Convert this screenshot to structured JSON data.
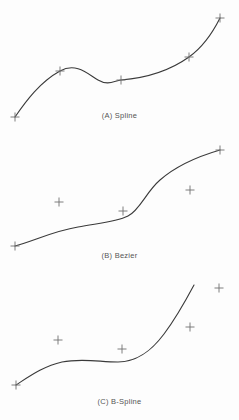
{
  "figure": {
    "width": 239,
    "height": 420,
    "background_color": "#fdfdfd",
    "curve_color": "#3a3a3a",
    "marker_color": "#707070",
    "caption_color": "#555555",
    "curve_width": 1.1,
    "marker_size": 9,
    "marker_glyph": "plus"
  },
  "chart_data": {
    "type": "line",
    "title": "",
    "xlabel": "",
    "ylabel": "",
    "grid": false,
    "legend": "none",
    "xlim": [
      0,
      239
    ],
    "ylim": [
      0,
      420
    ],
    "panels": [
      {
        "id": "A",
        "label": "(A) Spline",
        "interpolating": true,
        "control_points": [
          {
            "x": 15,
            "y": 117
          },
          {
            "x": 60,
            "y": 71
          },
          {
            "x": 121,
            "y": 80
          },
          {
            "x": 189,
            "y": 57
          },
          {
            "x": 220,
            "y": 18
          }
        ],
        "curve_path": "M 15 117 C 26 101 40 82 60 71 C 76 62 88 74 98 80 C 108 86 114 81 121 80 C 146 78 168 72 189 57 C 203 47 213 32 220 18",
        "curve_endpoints": [
          {
            "x": 15,
            "y": 117
          },
          {
            "x": 220,
            "y": 18
          }
        ],
        "note": "Curve passes exactly through every control point."
      },
      {
        "id": "B",
        "label": "(B) Bezier",
        "interpolating": false,
        "control_points": [
          {
            "x": 15,
            "y": 246
          },
          {
            "x": 59,
            "y": 202
          },
          {
            "x": 123,
            "y": 211
          },
          {
            "x": 190,
            "y": 190
          },
          {
            "x": 220,
            "y": 150
          }
        ],
        "curve_path": "M 15 246 C 36 240 54 231 78 227 C 100 223 116 222 128 216 C 140 210 146 192 160 180 C 176 166 196 157 220 150",
        "curve_endpoints": [
          {
            "x": 15,
            "y": 246
          },
          {
            "x": 220,
            "y": 150
          }
        ],
        "note": "Curve touches only the first and last control points; interior points pull the shape without being touched."
      },
      {
        "id": "C",
        "label": "(C) B-Spline",
        "interpolating": false,
        "control_points": [
          {
            "x": 16,
            "y": 385
          },
          {
            "x": 58,
            "y": 340
          },
          {
            "x": 122,
            "y": 349
          },
          {
            "x": 190,
            "y": 327
          },
          {
            "x": 219,
            "y": 288
          }
        ],
        "curve_path": "M 16 385 C 30 376 44 366 62 362 C 82 358 100 362 118 362 C 138 362 152 350 164 334 C 176 318 186 300 194 285",
        "curve_endpoints": [
          {
            "x": 16,
            "y": 385
          },
          {
            "x": 194,
            "y": 285
          }
        ],
        "note": "Curve begins near the first point and stops short of the last control point."
      }
    ]
  }
}
